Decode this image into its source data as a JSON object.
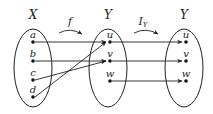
{
  "diagram": {
    "sets": [
      {
        "id": "X",
        "label": "X",
        "elements": [
          "a",
          "b",
          "c",
          "d"
        ]
      },
      {
        "id": "Y1",
        "label": "Y",
        "elements": [
          "u",
          "v",
          "w"
        ]
      },
      {
        "id": "Y2",
        "label": "Y",
        "elements": [
          "u",
          "v",
          "w"
        ]
      }
    ],
    "functions": [
      {
        "label": "f",
        "subscript": "",
        "from": "X",
        "to": "Y1",
        "mapping": [
          [
            "a",
            "u"
          ],
          [
            "b",
            "v"
          ],
          [
            "c",
            "v"
          ],
          [
            "d",
            "u"
          ]
        ]
      },
      {
        "label": "I",
        "subscript": "Y",
        "from": "Y1",
        "to": "Y2",
        "mapping": [
          [
            "u",
            "u"
          ],
          [
            "v",
            "v"
          ],
          [
            "w",
            "w"
          ]
        ]
      }
    ]
  }
}
